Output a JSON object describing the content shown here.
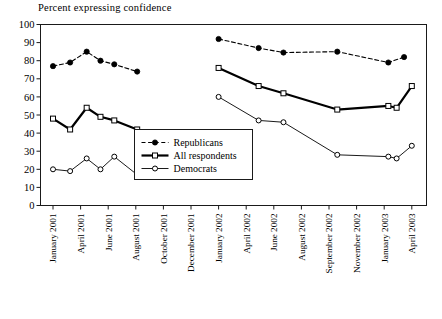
{
  "chart_data": {
    "type": "line",
    "title": "Percent expressing confidence",
    "xlabel": "",
    "ylabel": "",
    "ylim": [
      0,
      100
    ],
    "yticks": [
      0,
      10,
      20,
      30,
      40,
      50,
      60,
      70,
      80,
      90,
      100
    ],
    "grid": false,
    "legend_position": "center-left inside plot",
    "categories": [
      "January 2001",
      "April 2001",
      "June 2001",
      "August 2001",
      "October 2001",
      "December 2001",
      "January 2002",
      "April 2002",
      "June 2002",
      "August 2002",
      "September 2002",
      "November 2002",
      "January 2003",
      "April 2003"
    ],
    "series": [
      {
        "name": "Republicans",
        "marker": "filled-circle",
        "line": "dashed",
        "color": "#000000",
        "segments": [
          {
            "x": [
              0.0,
              0.62,
              1.22,
              1.72,
              2.22,
              3.05
            ],
            "values": [
              77,
              79,
              85,
              80,
              78,
              74
            ]
          },
          {
            "x": [
              6.0,
              7.45,
              8.35,
              10.3,
              12.15,
              12.72
            ],
            "values": [
              92,
              87,
              84.5,
              85,
              79,
              82
            ]
          }
        ]
      },
      {
        "name": "All respondents",
        "marker": "open-square",
        "line": "solid-thick",
        "color": "#000000",
        "segments": [
          {
            "x": [
              0.0,
              0.62,
              1.22,
              1.72,
              2.22,
              3.05
            ],
            "values": [
              48,
              42,
              54,
              49,
              47,
              42
            ]
          },
          {
            "x": [
              6.0,
              7.45,
              8.35,
              10.3,
              12.15,
              12.45,
              13.0
            ],
            "values": [
              76,
              66,
              62,
              53,
              55,
              54,
              66
            ]
          }
        ]
      },
      {
        "name": "Democrats",
        "marker": "open-circle",
        "line": "solid-thin",
        "color": "#000000",
        "segments": [
          {
            "x": [
              0.0,
              0.62,
              1.22,
              1.72,
              2.22,
              3.05
            ],
            "values": [
              20,
              19,
              26,
              20,
              27,
              17
            ]
          },
          {
            "x": [
              6.0,
              7.45,
              8.35,
              10.3,
              12.15,
              12.45,
              13.0
            ],
            "values": [
              60,
              47,
              46,
              28,
              27,
              26,
              33
            ]
          }
        ]
      }
    ]
  },
  "legend": {
    "items": [
      {
        "label": "Republicans"
      },
      {
        "label": "All respondents"
      },
      {
        "label": "Democrats"
      }
    ]
  }
}
